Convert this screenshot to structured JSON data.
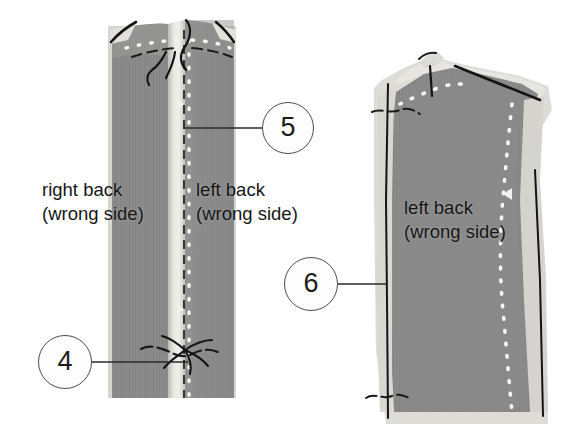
{
  "diagram": {
    "background_color": "#ffffff"
  },
  "callouts": [
    {
      "id": "callout-4",
      "number": "4",
      "cx": 65,
      "cy": 362,
      "r": 27,
      "leader_to_x": 188,
      "leader_to_y": 362
    },
    {
      "id": "callout-5",
      "number": "5",
      "cx": 288,
      "cy": 128,
      "r": 26,
      "leader_to_x": 185,
      "leader_to_y": 128
    },
    {
      "id": "callout-6",
      "number": "6",
      "cx": 311,
      "cy": 284,
      "r": 27,
      "leader_to_x": 386,
      "leader_to_y": 284
    }
  ],
  "labels": [
    {
      "id": "label-right-back",
      "line1": "right back",
      "line2": "(wrong side)",
      "x": 42,
      "y": 178
    },
    {
      "id": "label-left-back-1",
      "line1": "left back",
      "line2": "(wrong side)",
      "x": 196,
      "y": 178
    },
    {
      "id": "label-left-back-2",
      "line1": "left back",
      "line2": "(wrong side)",
      "x": 404,
      "y": 196
    }
  ],
  "colors": {
    "fabric_main": "#8c8c8c",
    "fabric_shadow": "#7f7f7f",
    "fabric_light": "#c9c9c4",
    "fabric_lighter": "#dedcd6",
    "fabric_highlight": "#efeee9",
    "stitch_white": "#f4f3ef",
    "thread_dark": "#1a1a1a",
    "callout_stroke": "#4a4a4a",
    "leader_line": "#2a2a2a"
  },
  "panels": [
    {
      "id": "panel-left-center-back",
      "description": "joined right back and left back panels at center back seam",
      "bounds": {
        "x": 106,
        "y": 14,
        "w": 130,
        "h": 385
      }
    },
    {
      "id": "panel-right-left-back",
      "description": "single left back panel showing finished seam",
      "bounds": {
        "x": 372,
        "y": 46,
        "w": 180,
        "h": 380
      }
    }
  ],
  "stitch_lines": {
    "center_seam_dashed": "vertical dashed seam line on left panel",
    "basting_dots": "white dotted basting stitches",
    "shoulder_dark": "dark thread lines at shoulder edges",
    "thread_tails": "loose dark thread tails"
  }
}
